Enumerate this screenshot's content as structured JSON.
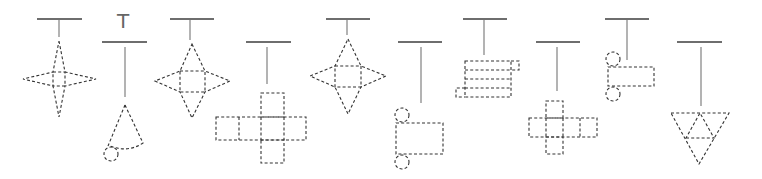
{
  "figure": {
    "colors": {
      "bar": "#6e6e6e",
      "string": "#8a8a8a",
      "dashed_net": "#333333",
      "background": "#ffffff"
    },
    "label_glyph": "T",
    "items": [
      {
        "index": 1,
        "shape": "four-pointed star net (square pyramid net, slender)"
      },
      {
        "index": 2,
        "shape": "cone net (sector with circle base)"
      },
      {
        "index": 3,
        "shape": "square pyramid net"
      },
      {
        "index": 4,
        "shape": "cube net (cross)"
      },
      {
        "index": 5,
        "shape": "square pyramid net"
      },
      {
        "index": 6,
        "shape": "cylinder net (rectangle with two circles)"
      },
      {
        "index": 7,
        "shape": "stacked rectangular prism net"
      },
      {
        "index": 8,
        "shape": "cube net (cross, small)"
      },
      {
        "index": 9,
        "shape": "cylinder net (small rectangle with two circles)"
      },
      {
        "index": 10,
        "shape": "triangular pyramid net (tetrahedron)"
      }
    ]
  }
}
